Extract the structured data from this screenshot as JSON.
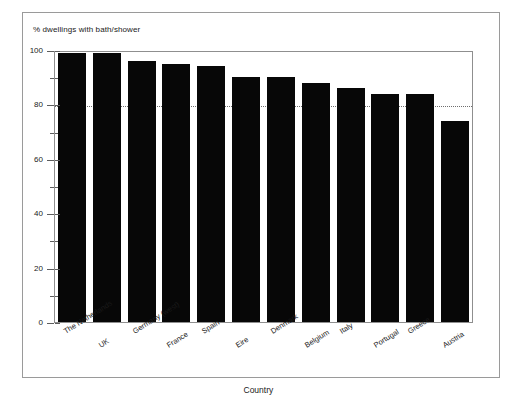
{
  "figure": {
    "border_color": "#9a9a9a",
    "background": "#ffffff"
  },
  "chart_data": {
    "type": "bar",
    "title": "",
    "subtitle": "",
    "ylabel": "% dwellings with bath/shower",
    "xlabel": "Country",
    "categories": [
      "The Netherlands",
      "UK",
      "Germany (west)",
      "France",
      "Spain",
      "Eire",
      "Denmark",
      "Belgium",
      "Italy",
      "Portugal",
      "Greece",
      "Austria"
    ],
    "values": [
      99,
      99,
      96,
      95,
      94,
      90,
      90,
      88,
      86,
      84,
      84,
      74
    ],
    "ylim": [
      0,
      100
    ],
    "yticks": [
      0,
      20,
      40,
      60,
      80,
      100
    ],
    "ytick_labels": [
      "0",
      "20",
      "40",
      "60",
      "80",
      "100"
    ],
    "yminor_ticks": [
      10,
      30,
      50,
      70,
      90
    ],
    "grid": true,
    "gridlines": [
      80
    ],
    "grid_style": "dotted",
    "legend": "none",
    "bar_color": "#070707",
    "bar_count": 12
  }
}
